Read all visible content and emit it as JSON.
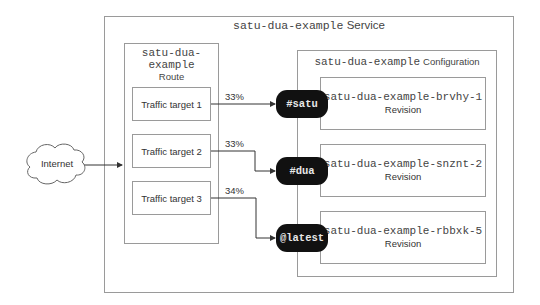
{
  "service": {
    "name": "satu-dua-example",
    "kind": "Service"
  },
  "internet": {
    "label": "Internet"
  },
  "route": {
    "name_line1": "satu-dua-",
    "name_line2": "example",
    "kind": "Route",
    "targets": [
      {
        "label": "Traffic target 1",
        "percent": "33%",
        "tag": "#satu"
      },
      {
        "label": "Traffic target 2",
        "percent": "33%",
        "tag": "#dua"
      },
      {
        "label": "Traffic target 3",
        "percent": "34%",
        "tag": "@latest"
      }
    ]
  },
  "configuration": {
    "name": "satu-dua-example",
    "kind": "Configuration",
    "revisions": [
      {
        "name": "satu-dua-example-brvhy-1",
        "kind": "Revision"
      },
      {
        "name": "satu-dua-example-snznt-2",
        "kind": "Revision"
      },
      {
        "name": "satu-dua-example-rbbxk-5",
        "kind": "Revision"
      }
    ]
  },
  "colors": {
    "border": "#9a9a9a",
    "line": "#333333",
    "tag_bg": "#111111",
    "tag_text": "#e8e8e8"
  }
}
